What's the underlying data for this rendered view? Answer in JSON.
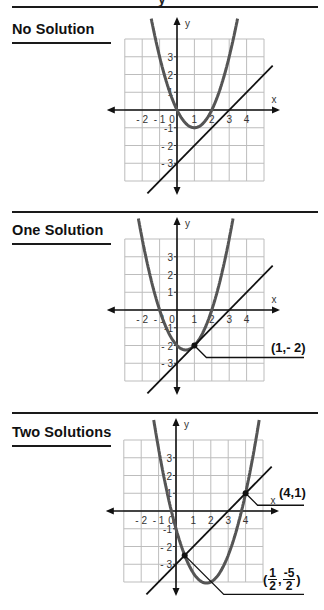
{
  "page": {
    "top_clipped_text": "y"
  },
  "sections": [
    {
      "title": "No Solution",
      "callouts": []
    },
    {
      "title": "One Solution",
      "callouts": [
        {
          "label": "(1,- 2)",
          "point": [
            1,
            -2
          ]
        }
      ]
    },
    {
      "title": "Two Solutions",
      "callouts": [
        {
          "label": "(4,1)",
          "point": [
            4,
            1
          ]
        },
        {
          "label_open": "(",
          "frac1_num": "1",
          "frac1_den": "2",
          "sep": ",",
          "frac2_num": "-5",
          "frac2_den": "2",
          "label_close": ")",
          "point": [
            0.5,
            -2.5
          ]
        }
      ]
    }
  ],
  "axes": {
    "x_label": "x",
    "y_label": "y",
    "x_ticks": [
      "- 2",
      "- 1",
      "0",
      "1",
      "2",
      "3",
      "4"
    ],
    "y_ticks": [
      "3",
      "2",
      "1",
      "-1",
      "- 2",
      "- 3"
    ]
  },
  "chart_data": [
    {
      "type": "line",
      "title": "No Solution",
      "xlabel": "x",
      "ylabel": "y",
      "xlim": [
        -3,
        5
      ],
      "ylim": [
        -4,
        4
      ],
      "grid": true,
      "series": [
        {
          "name": "parabola",
          "equation": "y = x^2 - 2x",
          "color": "#555555",
          "vertex": [
            1,
            -1
          ],
          "roots": [
            0,
            2
          ]
        },
        {
          "name": "line",
          "equation": "y = x - 3",
          "color": "#111111",
          "y_intercept": -3,
          "x_intercept": 3
        }
      ],
      "intersections": []
    },
    {
      "type": "line",
      "title": "One Solution",
      "xlabel": "x",
      "ylabel": "y",
      "xlim": [
        -3,
        5
      ],
      "ylim": [
        -4,
        4
      ],
      "grid": true,
      "series": [
        {
          "name": "parabola",
          "equation": "y = x^2 - x - 2",
          "color": "#555555",
          "vertex": [
            0.5,
            -2.25
          ],
          "roots": [
            -1,
            2
          ]
        },
        {
          "name": "line",
          "equation": "y = x - 3",
          "color": "#111111",
          "y_intercept": -3,
          "x_intercept": 3
        }
      ],
      "intersections": [
        [
          1,
          -2
        ]
      ],
      "annotations": [
        "(1,- 2)"
      ]
    },
    {
      "type": "line",
      "title": "Two Solutions",
      "xlabel": "x",
      "ylabel": "y",
      "xlim": [
        -3,
        5
      ],
      "ylim": [
        -4,
        4
      ],
      "grid": true,
      "series": [
        {
          "name": "parabola",
          "equation": "y = x^2 - 3.5x - 1",
          "color": "#555555",
          "vertex": [
            1.75,
            -4.06
          ]
        },
        {
          "name": "line",
          "equation": "y = x - 3",
          "color": "#111111",
          "y_intercept": -3,
          "x_intercept": 3
        }
      ],
      "intersections": [
        [
          4,
          1
        ],
        [
          0.5,
          -2.5
        ]
      ],
      "annotations": [
        "(4,1)",
        "(1/2, -5/2)"
      ]
    }
  ]
}
